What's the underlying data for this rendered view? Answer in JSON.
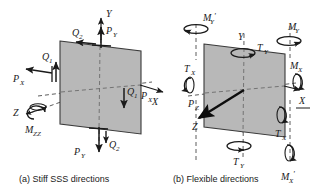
{
  "figure": {
    "background": "#ffffff",
    "plate_fill": "#b8b8b8",
    "plate_stroke": "#3a3a3a",
    "ink": "#1a1a1a"
  },
  "panels": [
    {
      "id": "panel-a",
      "caption": "(a) Stiff SSS directions",
      "axes": [
        {
          "name": "axis-y",
          "label": "Y"
        },
        {
          "name": "axis-x",
          "label": "X"
        },
        {
          "name": "axis-z",
          "label": "Z"
        }
      ],
      "force_labels": [
        {
          "name": "load-q2-top",
          "text": "Q",
          "sub": "2"
        },
        {
          "name": "load-py-top",
          "text": "P",
          "sub": "Y"
        },
        {
          "name": "load-q1-left",
          "text": "Q",
          "sub": "1"
        },
        {
          "name": "load-px-left",
          "text": "P",
          "sub": "X"
        },
        {
          "name": "load-q1-right",
          "text": "Q",
          "sub": "1"
        },
        {
          "name": "load-px-right",
          "text": "P",
          "sub": "X"
        },
        {
          "name": "load-q2-bottom",
          "text": "Q",
          "sub": "2"
        },
        {
          "name": "load-py-bottom",
          "text": "P",
          "sub": "Y"
        },
        {
          "name": "moment-mzz",
          "text": "M",
          "sub": "ZZ"
        }
      ]
    },
    {
      "id": "panel-b",
      "caption": "(b) Flexible directions",
      "axes": [
        {
          "name": "axis-y",
          "label": "Y"
        },
        {
          "name": "axis-x",
          "label": "X"
        },
        {
          "name": "axis-z",
          "label": "Z"
        }
      ],
      "force_labels": [
        {
          "name": "moment-my-prime-topleft",
          "text": "M",
          "sub": "Y",
          "prime": "'"
        },
        {
          "name": "moment-my-topright",
          "text": "M",
          "sub": "Y",
          "prime": ""
        },
        {
          "name": "torque-ty-top",
          "text": "T",
          "sub": "Y",
          "prime": ""
        },
        {
          "name": "torque-tx-left",
          "text": "T",
          "sub": "X",
          "prime": ""
        },
        {
          "name": "moment-mx-right",
          "text": "M",
          "sub": "X",
          "prime": ""
        },
        {
          "name": "load-pz",
          "text": "P",
          "sub": "Z",
          "prime": ""
        },
        {
          "name": "torque-tx-bottomright",
          "text": "T",
          "sub": "X",
          "prime": ""
        },
        {
          "name": "torque-ty-bottom",
          "text": "T",
          "sub": "Y",
          "prime": ""
        },
        {
          "name": "moment-mx-prime-bottom",
          "text": "M",
          "sub": "X",
          "prime": "'"
        }
      ]
    }
  ]
}
